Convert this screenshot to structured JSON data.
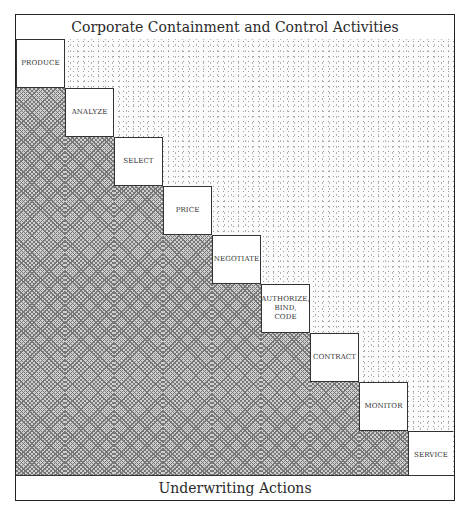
{
  "diagram": {
    "header": "Corporate Containment and Control Activities",
    "footer": "Underwriting Actions",
    "steps": [
      {
        "label": "PRODUCE"
      },
      {
        "label": "ANALYZE"
      },
      {
        "label": "SELECT"
      },
      {
        "label": "PRICE"
      },
      {
        "label": "NEGOTIATE"
      },
      {
        "label": "AUTHORIZE,\nBIND,\nCODE"
      },
      {
        "label": "CONTRACT"
      },
      {
        "label": "MONITOR"
      },
      {
        "label": "SERVICE"
      }
    ],
    "regions": {
      "upper_right": "stippled",
      "lower_left": "cross-hatched"
    }
  }
}
